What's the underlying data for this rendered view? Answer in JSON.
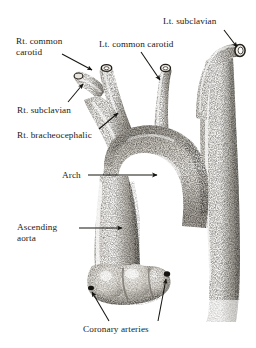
{
  "figure": {
    "style": "stippled pencil / engraving, grayscale",
    "background_color": "#ffffff",
    "ink_color": "#1a1a18",
    "width": 256,
    "height": 348
  },
  "labels": [
    {
      "id": "lt-subclavian",
      "text": "Lt. subclavian",
      "x": 163,
      "y": 16,
      "align": "left",
      "lines": [
        "Lt. subclavian"
      ]
    },
    {
      "id": "rt-common-carotid",
      "text": "Rt. common\ncarotid",
      "x": 16,
      "y": 36,
      "align": "left",
      "lines": [
        "Rt. common",
        "carotid"
      ]
    },
    {
      "id": "lt-common-carotid",
      "text": "Lt. common carotid",
      "x": 99,
      "y": 39,
      "align": "left",
      "lines": [
        "Lt. common carotid"
      ]
    },
    {
      "id": "rt-subclavian",
      "text": "Rt. subclavian",
      "x": 17,
      "y": 105,
      "align": "left",
      "lines": [
        "Rt. subclavian"
      ]
    },
    {
      "id": "rt-bracheocephalic",
      "text": "Rt. bracheocephalic",
      "x": 17,
      "y": 130,
      "align": "left",
      "lines": [
        "Rt. bracheocephalic"
      ]
    },
    {
      "id": "arch",
      "text": "Arch",
      "x": 62,
      "y": 170,
      "align": "left",
      "lines": [
        "Arch"
      ]
    },
    {
      "id": "ascending-aorta",
      "text": "Ascending\naorta",
      "x": 17,
      "y": 222,
      "align": "left",
      "lines": [
        "Ascending",
        "aorta"
      ]
    },
    {
      "id": "coronary-arteries",
      "text": "Coronary arteries",
      "x": 83,
      "y": 324,
      "align": "left",
      "lines": [
        "Coronary arteries"
      ]
    }
  ],
  "leader_lines": [
    {
      "id": "leader-lt-subclavian",
      "from": [
        224,
        30
      ],
      "to": [
        238,
        48
      ],
      "arrow": true
    },
    {
      "id": "leader-rt-common-carotid",
      "from": [
        62,
        54
      ],
      "to": [
        92,
        70
      ],
      "arrow": true
    },
    {
      "id": "leader-lt-common-carotid",
      "from": [
        140,
        52
      ],
      "to": [
        161,
        80
      ],
      "arrow": true
    },
    {
      "id": "leader-rt-subclavian",
      "from": [
        68,
        103
      ],
      "to": [
        83,
        83
      ],
      "arrow": true
    },
    {
      "id": "leader-rt-bracheocephalic",
      "from": [
        98,
        130
      ],
      "to": [
        119,
        113
      ],
      "arrow": true
    },
    {
      "id": "leader-arch",
      "from": [
        88,
        174
      ],
      "to": [
        158,
        174
      ],
      "arrow": true
    },
    {
      "id": "leader-ascending-aorta",
      "from": [
        78,
        227
      ],
      "to": [
        123,
        227
      ],
      "arrow": true
    },
    {
      "id": "leader-coronary-left",
      "from": [
        108,
        322
      ],
      "to": [
        92,
        290
      ],
      "arrow": true
    },
    {
      "id": "leader-coronary-right",
      "from": [
        158,
        322
      ],
      "to": [
        166,
        288
      ],
      "arrow": true
    }
  ],
  "structures": [
    {
      "id": "lt-subclavian-artery",
      "name": "Left subclavian artery"
    },
    {
      "id": "lt-common-carotid-artery",
      "name": "Left common carotid artery"
    },
    {
      "id": "rt-common-carotid-artery",
      "name": "Right common carotid artery"
    },
    {
      "id": "rt-subclavian-artery",
      "name": "Right subclavian artery"
    },
    {
      "id": "brachiocephalic-trunk",
      "name": "Right brachiocephalic trunk"
    },
    {
      "id": "aortic-arch",
      "name": "Aortic arch"
    },
    {
      "id": "ascending-aorta-vessel",
      "name": "Ascending aorta"
    },
    {
      "id": "descending-aorta-vessel",
      "name": "Descending aorta"
    },
    {
      "id": "aortic-root",
      "name": "Aortic root and sinuses"
    },
    {
      "id": "coronary-ostia",
      "name": "Coronary artery ostia"
    }
  ]
}
